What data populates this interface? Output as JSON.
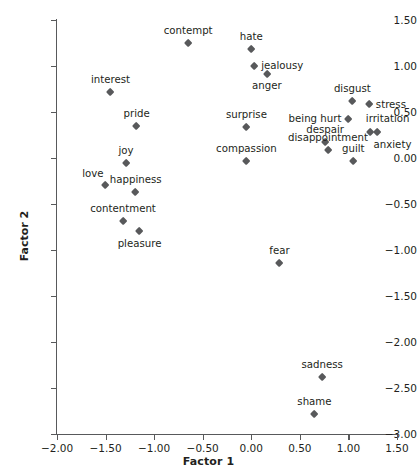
{
  "chart_data": {
    "type": "scatter",
    "title": "",
    "xlabel": "Factor 1",
    "ylabel": "Factor 2",
    "xlim": [
      -2.0,
      1.5
    ],
    "ylim": [
      -3.0,
      1.5
    ],
    "grid": false,
    "legend": null,
    "xticks": [
      "-2.00",
      "-1.50",
      "-1.00",
      "-0.50",
      "0.00",
      "0.50",
      "1.00",
      "1.50"
    ],
    "xtick_values": [
      -2.0,
      -1.5,
      -1.0,
      -0.5,
      0.0,
      0.5,
      1.0,
      1.5
    ],
    "yticks": [
      "1.50",
      "1.00",
      "0.50",
      "0.00",
      "-0.50",
      "-1.00",
      "-1.50",
      "-2.00",
      "-2.50",
      "-3.00"
    ],
    "ytick_values": [
      1.5,
      1.0,
      0.5,
      0.0,
      -0.5,
      -1.0,
      -1.5,
      -2.0,
      -2.5,
      -3.0
    ],
    "marker_color": "#58595b",
    "marker_shape": "diamond",
    "points": [
      {
        "label": "contempt",
        "x": -0.65,
        "y": 1.25,
        "lpos": "above"
      },
      {
        "label": "hate",
        "x": 0.0,
        "y": 1.18,
        "lpos": "above"
      },
      {
        "label": "jealousy",
        "x": 0.03,
        "y": 1.0,
        "lpos": "right"
      },
      {
        "label": "anger",
        "x": 0.16,
        "y": 0.91,
        "lpos": "below"
      },
      {
        "label": "interest",
        "x": -1.45,
        "y": 0.71,
        "lpos": "above"
      },
      {
        "label": "disgust",
        "x": 1.04,
        "y": 0.62,
        "lpos": "above"
      },
      {
        "label": "stress",
        "x": 1.21,
        "y": 0.58,
        "lpos": "right"
      },
      {
        "label": "being hurt",
        "x": 1.0,
        "y": 0.42,
        "lpos": "left"
      },
      {
        "label": "pride",
        "x": -1.18,
        "y": 0.35,
        "lpos": "above"
      },
      {
        "label": "surprise",
        "x": -0.05,
        "y": 0.34,
        "lpos": "above"
      },
      {
        "label": "despair",
        "x": 0.76,
        "y": 0.17,
        "lpos": "above"
      },
      {
        "label": "irritation",
        "x": 1.22,
        "y": 0.28,
        "lpos": "above-right"
      },
      {
        "label": "anxiety",
        "x": 1.3,
        "y": 0.28,
        "lpos": "below-right"
      },
      {
        "label": "disappointment",
        "x": 0.79,
        "y": 0.09,
        "lpos": "above"
      },
      {
        "label": "compassion",
        "x": -0.05,
        "y": -0.04,
        "lpos": "above"
      },
      {
        "label": "joy",
        "x": -1.29,
        "y": -0.06,
        "lpos": "above"
      },
      {
        "label": "guilt",
        "x": 1.05,
        "y": -0.04,
        "lpos": "above"
      },
      {
        "label": "love",
        "x": -1.5,
        "y": -0.3,
        "lpos": "above-left"
      },
      {
        "label": "happiness",
        "x": -1.19,
        "y": -0.37,
        "lpos": "above"
      },
      {
        "label": "contentment",
        "x": -1.32,
        "y": -0.69,
        "lpos": "above"
      },
      {
        "label": "pleasure",
        "x": -1.15,
        "y": -0.8,
        "lpos": "below"
      },
      {
        "label": "fear",
        "x": 0.29,
        "y": -1.14,
        "lpos": "above"
      },
      {
        "label": "sadness",
        "x": 0.73,
        "y": -2.38,
        "lpos": "above"
      },
      {
        "label": "shame",
        "x": 0.65,
        "y": -2.79,
        "lpos": "above"
      }
    ]
  }
}
